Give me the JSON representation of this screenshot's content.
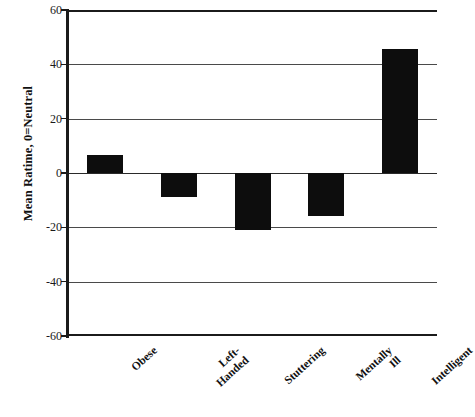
{
  "chart_data": {
    "type": "bar",
    "title": "",
    "subtitle": "",
    "xlabel": "",
    "ylabel": "Mean Ratime, 0=Neutral",
    "categories": [
      "Obese",
      "Left-Handed",
      "Stuttering",
      "Mentally Ill",
      "Intelligent"
    ],
    "category_lines": [
      [
        "Obese"
      ],
      [
        "Left-",
        "Handed"
      ],
      [
        "Stuttering"
      ],
      [
        "Mentally",
        "Ill"
      ],
      [
        "Intelligent"
      ]
    ],
    "values": [
      6.5,
      -9,
      -21,
      -16,
      45.5
    ],
    "ylim": [
      -60,
      60
    ],
    "yticks": [
      60,
      40,
      20,
      0,
      -20,
      -40,
      -60
    ],
    "ytick_labels": [
      "60",
      "40",
      "20",
      "0",
      "-20",
      "-40",
      "-60"
    ],
    "grid": true,
    "grid_axis": "y",
    "legend": false,
    "bar_color": "#0d0d0d",
    "axis_color": "#1b1b1b",
    "gridline_color": "#4a4a4a",
    "background_color": "#ffffff"
  }
}
